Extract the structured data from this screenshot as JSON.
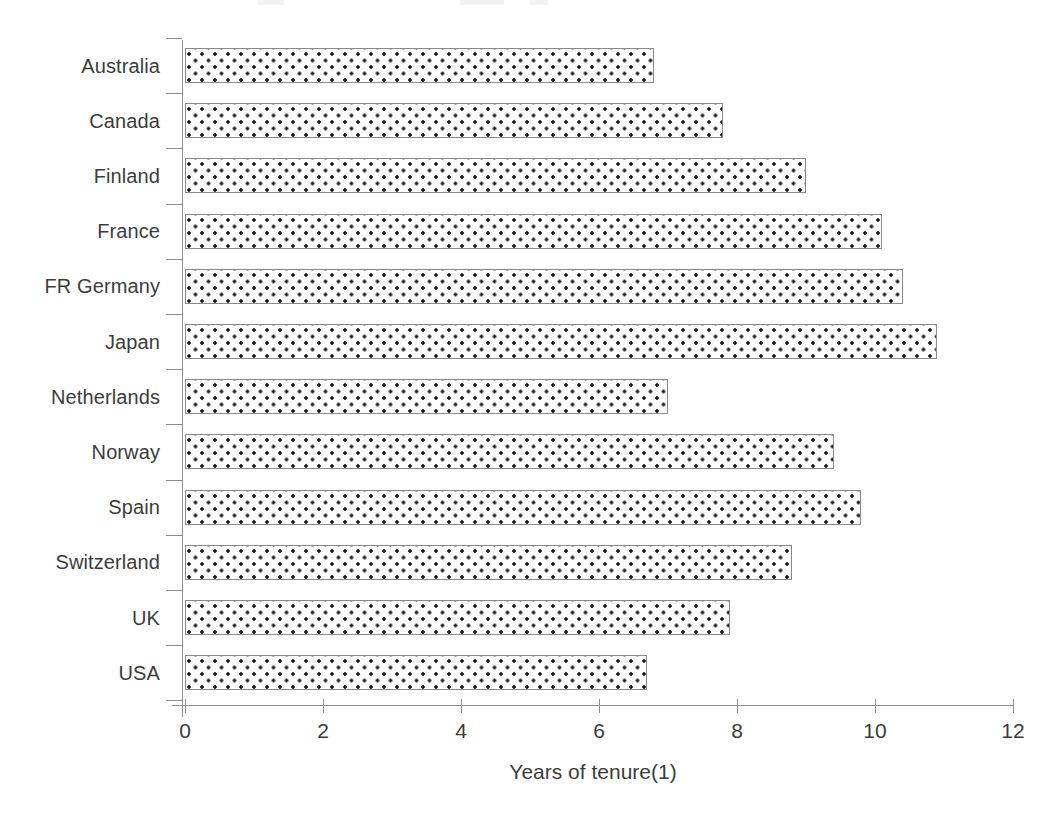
{
  "chart_data": {
    "type": "bar",
    "orientation": "horizontal",
    "title": "",
    "xlabel": "Years of tenure(1)",
    "ylabel": "",
    "xlim": [
      0,
      12
    ],
    "xticks": [
      0,
      2,
      4,
      6,
      8,
      10,
      12
    ],
    "xtick_labels": [
      "0",
      "2",
      "4",
      "6",
      "8",
      "10",
      "12"
    ],
    "grid": false,
    "legend": null,
    "categories": [
      "Australia",
      "Canada",
      "Finland",
      "France",
      "FR Germany",
      "Japan",
      "Netherlands",
      "Norway",
      "Spain",
      "Switzerland",
      "UK",
      "USA"
    ],
    "values": [
      6.8,
      7.8,
      9.0,
      10.1,
      10.4,
      10.9,
      7.0,
      9.4,
      9.8,
      8.8,
      7.9,
      6.7
    ],
    "series": [
      {
        "name": "Years of tenure(1)",
        "values": [
          6.8,
          7.8,
          9.0,
          10.1,
          10.4,
          10.9,
          7.0,
          9.4,
          9.8,
          8.8,
          7.9,
          6.7
        ]
      }
    ],
    "bar_fill": "dotted-pattern",
    "bar_border_color": "#8a8a8a",
    "axis_color": "#8d8d8d",
    "text_color": "#3c3c3c"
  },
  "axis": {
    "x_title": "Years of tenure(1)"
  }
}
